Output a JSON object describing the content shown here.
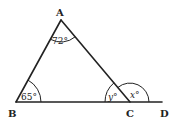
{
  "diagram": {
    "type": "triangle-exterior-angle",
    "points": {
      "A": {
        "label": "A",
        "x": 61,
        "y": 20
      },
      "B": {
        "label": "B",
        "x": 16,
        "y": 102
      },
      "C": {
        "label": "C",
        "x": 130,
        "y": 102
      },
      "D": {
        "label": "D",
        "x": 162,
        "y": 102
      }
    },
    "segments": [
      "AB",
      "AC",
      "BC",
      "CD"
    ],
    "angles": {
      "A": {
        "label": "72°",
        "value": 72
      },
      "B": {
        "label": "65°",
        "value": 65
      },
      "y": {
        "label": "y°",
        "variable": "y",
        "vertex": "C",
        "between": "CA-CB"
      },
      "x": {
        "label": "x°",
        "variable": "x",
        "vertex": "C",
        "between": "CA-CD"
      }
    },
    "colors": {
      "stroke": "#222222",
      "background": "#ffffff"
    }
  }
}
